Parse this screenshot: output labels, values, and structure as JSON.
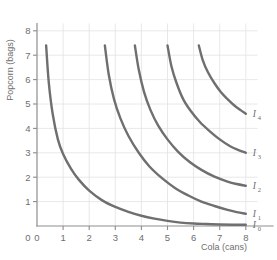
{
  "chart_data": {
    "type": "line",
    "title": "",
    "xlabel": "Cola (cans)",
    "ylabel": "Popcorn (bags)",
    "xlim": [
      0,
      8.6
    ],
    "ylim": [
      0,
      8.4
    ],
    "xticks": [
      "0",
      "1",
      "2",
      "3",
      "4",
      "5",
      "6",
      "7",
      "8"
    ],
    "yticks": [
      "0",
      "1",
      "2",
      "3",
      "4",
      "5",
      "6",
      "7",
      "8"
    ],
    "grid": true,
    "legend_position": "inline-right",
    "series": [
      {
        "name": "I0",
        "label_main": "I",
        "label_sub": "0",
        "x_start": 0.35,
        "y_start": 7.4,
        "x_end": 8.0,
        "y_end": 0.05,
        "points": [
          [
            0.35,
            7.4
          ],
          [
            0.45,
            5.9
          ],
          [
            0.6,
            4.6
          ],
          [
            0.8,
            3.55
          ],
          [
            1.0,
            2.95
          ],
          [
            1.3,
            2.35
          ],
          [
            1.6,
            1.9
          ],
          [
            2.0,
            1.45
          ],
          [
            2.5,
            1.05
          ],
          [
            3.0,
            0.78
          ],
          [
            3.5,
            0.58
          ],
          [
            4.0,
            0.42
          ],
          [
            4.5,
            0.3
          ],
          [
            5.0,
            0.21
          ],
          [
            5.5,
            0.14
          ],
          [
            6.0,
            0.1
          ],
          [
            6.5,
            0.08
          ],
          [
            7.0,
            0.06
          ],
          [
            7.5,
            0.05
          ],
          [
            8.0,
            0.05
          ]
        ]
      },
      {
        "name": "I1",
        "label_main": "I",
        "label_sub": "1",
        "x_start": 2.6,
        "y_start": 7.4,
        "x_end": 8.0,
        "y_end": 0.5,
        "points": [
          [
            2.6,
            7.4
          ],
          [
            2.75,
            6.2
          ],
          [
            2.95,
            5.2
          ],
          [
            3.2,
            4.4
          ],
          [
            3.5,
            3.7
          ],
          [
            3.9,
            3.0
          ],
          [
            4.3,
            2.45
          ],
          [
            4.8,
            1.95
          ],
          [
            5.3,
            1.55
          ],
          [
            5.8,
            1.25
          ],
          [
            6.3,
            1.0
          ],
          [
            6.8,
            0.82
          ],
          [
            7.3,
            0.66
          ],
          [
            7.65,
            0.57
          ],
          [
            8.0,
            0.5
          ]
        ]
      },
      {
        "name": "I2",
        "label_main": "I",
        "label_sub": "2",
        "x_start": 3.75,
        "y_start": 7.4,
        "x_end": 8.0,
        "y_end": 1.65,
        "points": [
          [
            3.75,
            7.4
          ],
          [
            3.9,
            6.4
          ],
          [
            4.1,
            5.5
          ],
          [
            4.35,
            4.75
          ],
          [
            4.65,
            4.1
          ],
          [
            5.0,
            3.55
          ],
          [
            5.4,
            3.05
          ],
          [
            5.85,
            2.62
          ],
          [
            6.3,
            2.3
          ],
          [
            6.8,
            2.02
          ],
          [
            7.3,
            1.82
          ],
          [
            7.65,
            1.72
          ],
          [
            8.0,
            1.65
          ]
        ]
      },
      {
        "name": "I3",
        "label_main": "I",
        "label_sub": "3",
        "x_start": 5.0,
        "y_start": 7.4,
        "x_end": 8.0,
        "y_end": 3.0,
        "points": [
          [
            5.0,
            7.4
          ],
          [
            5.15,
            6.55
          ],
          [
            5.35,
            5.85
          ],
          [
            5.6,
            5.2
          ],
          [
            5.9,
            4.7
          ],
          [
            6.25,
            4.25
          ],
          [
            6.6,
            3.9
          ],
          [
            7.0,
            3.55
          ],
          [
            7.4,
            3.27
          ],
          [
            7.7,
            3.12
          ],
          [
            8.0,
            3.0
          ]
        ]
      },
      {
        "name": "I4",
        "label_main": "I",
        "label_sub": "4",
        "x_start": 6.2,
        "y_start": 7.4,
        "x_end": 8.0,
        "y_end": 4.6,
        "points": [
          [
            6.2,
            7.4
          ],
          [
            6.35,
            6.8
          ],
          [
            6.55,
            6.3
          ],
          [
            6.8,
            5.85
          ],
          [
            7.05,
            5.48
          ],
          [
            7.3,
            5.2
          ],
          [
            7.55,
            4.95
          ],
          [
            7.8,
            4.75
          ],
          [
            8.0,
            4.6
          ]
        ]
      }
    ]
  },
  "colors": {
    "curve": "#6f6f6f",
    "axis": "#8d8d8d",
    "grid": "#e2e2e2",
    "text": "#6e6e6e",
    "background": "#ffffff"
  }
}
